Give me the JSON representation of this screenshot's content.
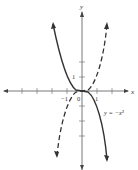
{
  "figure": {
    "x_axis_label": "x",
    "y_axis_label": "y",
    "tick_labels": {
      "neg_one": "−1",
      "zero": "0",
      "one": "1"
    },
    "curves": [
      {
        "name": "y = −x^3",
        "style": "solid",
        "label": "y = −x³",
        "color": "#333333"
      },
      {
        "name": "y = x^3",
        "style": "dashed",
        "label": "",
        "color": "#333333"
      }
    ],
    "axis_color": "#555555"
  }
}
